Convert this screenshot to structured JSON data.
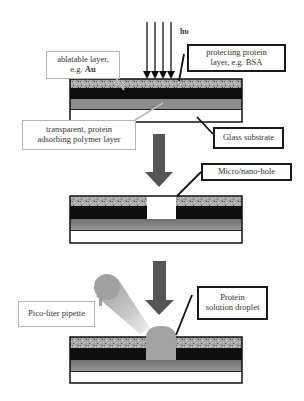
{
  "figure": {
    "illumination_label": "hυ",
    "labels": {
      "ablatable_layer": {
        "line1": "ablatable layer,",
        "line2_prefix": "e.g. ",
        "line2_bold": "Au"
      },
      "protecting_protein": {
        "line1": "protecting protein",
        "line2": "layer, e.g. BSA"
      },
      "transparent_polymer": {
        "line1": "transparent, protein",
        "line2": "adsorbing polymer layer"
      },
      "glass_substrate": "Glass substrate",
      "micro_nano_hole": "Micro/nano-hole",
      "pipette": "Pico-liter pipette",
      "droplet": {
        "line1": "Protein",
        "line2": "solution droplet"
      }
    },
    "colors": {
      "protein_layer": "#a9a9a9",
      "ablatable_layer": "#0d0d0d",
      "polymer_layer": "#8c8c8c",
      "glass": "#ffffff",
      "process_arrow": "#555555",
      "droplet": "#a3a3a3"
    },
    "steps": [
      "Laser ablation of layered substrate",
      "Formation of micro/nano-hole",
      "Pico-liter pipette deposits protein solution droplet"
    ]
  }
}
